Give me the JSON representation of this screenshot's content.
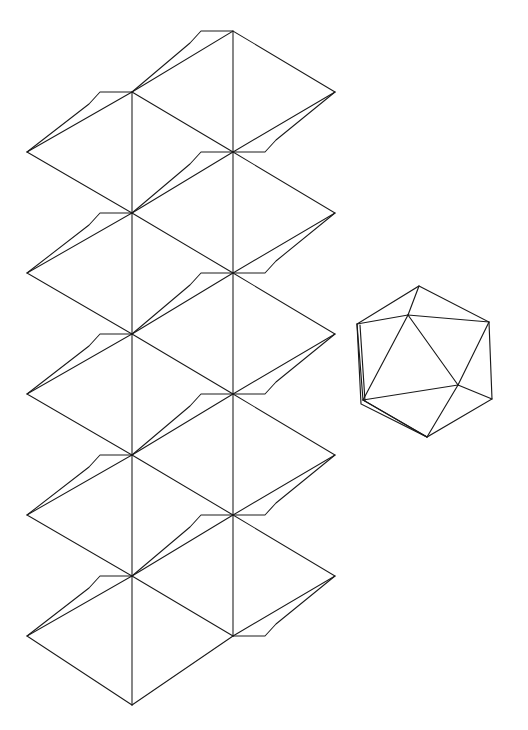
{
  "page": {
    "header_text": "",
    "background_color": "#ffffff",
    "line_color": "#1a1a1a",
    "width": 528,
    "height": 730
  },
  "figures": [
    {
      "id": "icosahedron-net",
      "name": "icosahedron-net",
      "label": "Icosahedron net (unfolded papercraft template)",
      "triangle_count": 20,
      "columns": 5,
      "rows": 4,
      "has_glue_tabs": true,
      "geometry": {
        "apex_top": [
          233,
          31
        ],
        "apex_bottom": [
          132,
          705
        ],
        "column_spacing": 100.5,
        "row_spacing": 60.5,
        "top_row_y": 31,
        "left_extreme_x": 27,
        "right_extreme_x": 335
      }
    },
    {
      "id": "icosahedron-solid",
      "name": "icosahedron-solid",
      "label": "Icosahedron (assembled wireframe view)",
      "face_count": 20,
      "vertex_count": 12,
      "center": [
        420,
        362
      ],
      "radius": 72
    }
  ]
}
